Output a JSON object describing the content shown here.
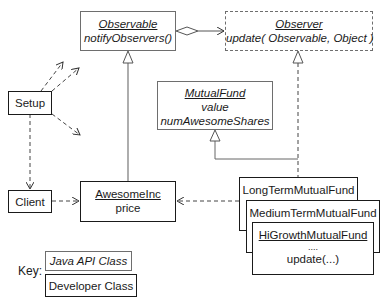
{
  "diagram": {
    "type": "UML class diagram (Observer pattern)",
    "classes": {
      "observable": {
        "name": "Observable",
        "members": [
          "notifyObservers()"
        ],
        "kind": "Java API Class"
      },
      "observer": {
        "name": "Observer",
        "members": [
          "update( Observable, Object )"
        ],
        "kind": "Java API Interface"
      },
      "mutual_fund": {
        "name": "MutualFund",
        "members": [
          "value",
          "numAwesomeShares"
        ],
        "kind": "Java API Class (abstract)"
      },
      "setup": {
        "name": "Setup",
        "kind": "Developer Class"
      },
      "client": {
        "name": "Client",
        "kind": "Developer Class"
      },
      "awesome_inc": {
        "name": "AwesomeInc",
        "members": [
          "price"
        ],
        "kind": "Developer Class"
      },
      "long_term": {
        "name": "LongTermMutualFund",
        "kind": "Developer Class"
      },
      "medium_term": {
        "name": "MediumTermMutualFund",
        "kind": "Developer Class"
      },
      "hi_growth": {
        "name": "HiGrowthMutualFund",
        "members": [
          "....",
          "update(...)"
        ],
        "kind": "Developer Class"
      }
    },
    "relationships": [
      {
        "from": "Observable",
        "to": "Observer",
        "type": "aggregation"
      },
      {
        "from": "AwesomeInc",
        "to": "Observable",
        "type": "inheritance"
      },
      {
        "from": "LongTermMutualFund",
        "to": "Observer",
        "type": "realization"
      },
      {
        "from": "LongTermMutualFund",
        "to": "MutualFund",
        "type": "inheritance"
      },
      {
        "from": "LongTermMutualFund",
        "to": "AwesomeInc",
        "type": "dependency"
      },
      {
        "from": "Client",
        "to": "AwesomeInc",
        "type": "dependency"
      },
      {
        "from": "Setup",
        "to": "Client",
        "type": "dependency"
      },
      {
        "from": "Setup",
        "to": "(unnamed)",
        "type": "dependency",
        "count": 3
      }
    ],
    "key": {
      "label": "Key:",
      "api_class": "Java API Class",
      "developer_class": "Developer Class"
    },
    "colors": {
      "api_border": "#6e6e6e",
      "developer_border": "#1a1a1a",
      "background": "#ffffff"
    }
  }
}
